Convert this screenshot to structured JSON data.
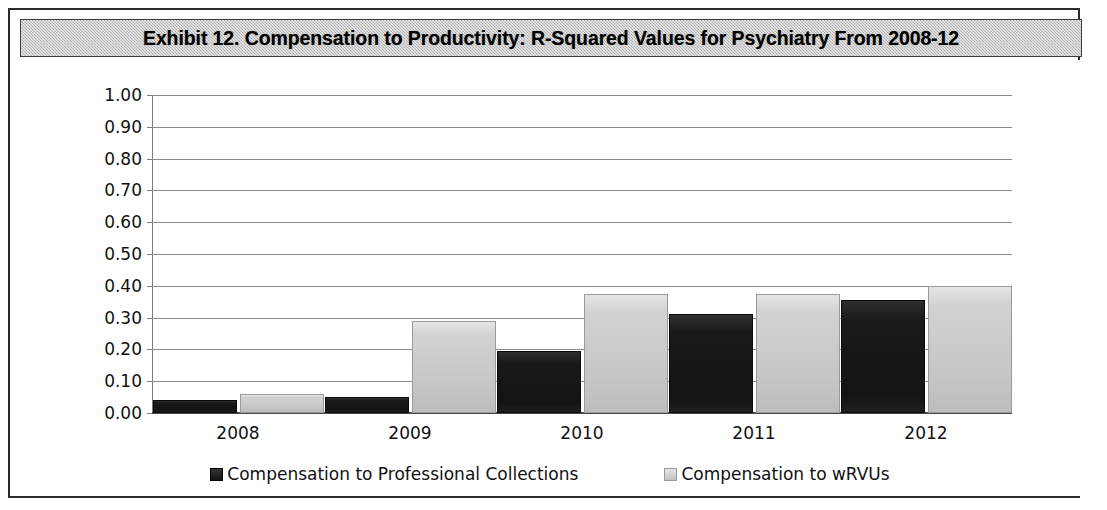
{
  "exhibit": {
    "title": "Exhibit 12. Compensation to Productivity: R-Squared Values for Psychiatry From 2008-12"
  },
  "colors": {
    "series_dark": "#1a1a1a",
    "series_light": "#c8c8c8",
    "gridline": "#8a8a8a",
    "axis": "#4a4a4a",
    "title_bar_background": "#c4c4c4",
    "panel_border": "#2b2b2b"
  },
  "chart_data": {
    "type": "bar",
    "title": "Exhibit 12. Compensation to Productivity: R-Squared Values for Psychiatry From 2008-12",
    "xlabel": "",
    "ylabel": "",
    "categories": [
      "2008",
      "2009",
      "2010",
      "2011",
      "2012"
    ],
    "series": [
      {
        "name": "Compensation to Professional Collections",
        "color": "#1a1a1a",
        "values": [
          0.04,
          0.05,
          0.195,
          0.31,
          0.355
        ]
      },
      {
        "name": "Compensation to wRVUs",
        "color": "#c8c8c8",
        "values": [
          0.06,
          0.29,
          0.375,
          0.375,
          0.4
        ]
      }
    ],
    "ylim": [
      0.0,
      1.0
    ],
    "ytick_step": 0.1,
    "ytick_labels": [
      "1.00",
      "0.90",
      "0.80",
      "0.70",
      "0.60",
      "0.50",
      "0.40",
      "0.30",
      "0.20",
      "0.10",
      "0.00"
    ],
    "grid": true,
    "legend_position": "bottom"
  }
}
